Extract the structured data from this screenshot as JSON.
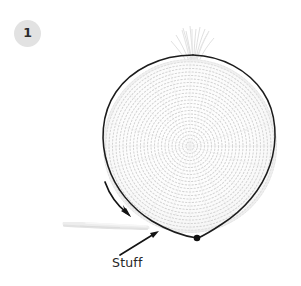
{
  "page": {
    "background_color": "#ffffff",
    "width": 301,
    "height": 286,
    "kind": "instructional-photo-with-annotations"
  },
  "step_badge": {
    "label": "1",
    "shape": "circle",
    "fill_color": "#e2e2e2",
    "text_color": "#2b2b2b",
    "center": {
      "x": 27,
      "y": 33
    },
    "diameter": 27
  },
  "subject": {
    "name": "crocheted-flat-circle",
    "description": "white crocheted round piece worked in a spiral",
    "center": {
      "x": 190,
      "y": 146
    },
    "radius": 87,
    "fabric_color": "#f7f7f7",
    "stitch_color": "#d6d6d6",
    "outline_color": "#1a1a1a",
    "features": [
      {
        "name": "yarn-fringe-top",
        "x": 196,
        "y": 30
      },
      {
        "name": "yarn-tail-left",
        "x": 66,
        "y": 226
      },
      {
        "name": "start-point-dot",
        "x": 197,
        "y": 238
      }
    ]
  },
  "annotations": {
    "outline_arrow": {
      "name": "direction-of-work-arrow",
      "color": "#141414",
      "from": {
        "x": 104,
        "y": 183
      },
      "to": {
        "x": 130,
        "y": 215
      }
    },
    "callout_arrow": {
      "name": "stuff-callout-arrow",
      "color": "#141414",
      "from": {
        "x": 121,
        "y": 256
      },
      "to": {
        "x": 158,
        "y": 231
      }
    },
    "callout_label": {
      "name": "stuff-label",
      "text": "Stuff",
      "color": "#262626",
      "x": 112,
      "y": 255
    }
  },
  "colors": {
    "badge_gray": "#e2e2e2",
    "ink": "#1a1a1a",
    "fabric": "#f7f7f7",
    "stitch": "#d6d6d6",
    "paper": "#ffffff"
  }
}
